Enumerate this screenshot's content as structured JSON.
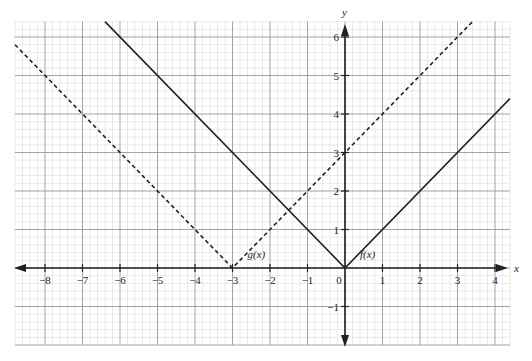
{
  "chart_data": {
    "type": "line",
    "title": "",
    "xlabel": "x",
    "ylabel": "y",
    "xlim": [
      -8.8,
      4.4
    ],
    "ylim": [
      -2.0,
      6.4
    ],
    "grid": true,
    "minor_grid_step": 0.2,
    "x_ticks": [
      -8,
      -7,
      -6,
      -5,
      -4,
      -3,
      -2,
      -1,
      0,
      1,
      2,
      3,
      4
    ],
    "y_ticks": [
      -1,
      1,
      2,
      3,
      4,
      5,
      6
    ],
    "x_tick_labels": [
      "−8",
      "−7",
      "−6",
      "−5",
      "−4",
      "−3",
      "−2",
      "−1",
      "0",
      "1",
      "2",
      "3",
      "4"
    ],
    "y_tick_labels": [
      "−1",
      "1",
      "2",
      "3",
      "4",
      "5",
      "6"
    ],
    "series": [
      {
        "name": "f(x)",
        "label": "f(x)",
        "style": "solid",
        "color": "#222222",
        "expression": "|x|",
        "points": [
          [
            -6.4,
            6.4
          ],
          [
            0,
            0
          ],
          [
            4.4,
            4.4
          ]
        ]
      },
      {
        "name": "g(x)",
        "label": "g(x)",
        "style": "dashed",
        "color": "#222222",
        "expression": "|x+3|",
        "points": [
          [
            -8.8,
            5.8
          ],
          [
            -3,
            0
          ],
          [
            3.4,
            6.4
          ]
        ]
      }
    ],
    "annotations": [
      {
        "text": "g(x)",
        "x": -2.6,
        "y": 0.2
      },
      {
        "text": "f(x)",
        "x": 0.4,
        "y": 0.2
      }
    ]
  },
  "axes": {
    "x_name": "x",
    "y_name": "y"
  },
  "colors": {
    "major_grid": "#9a9a9a",
    "minor_grid": "#d4d4d4",
    "axis": "#222222",
    "curve": "#222222"
  }
}
